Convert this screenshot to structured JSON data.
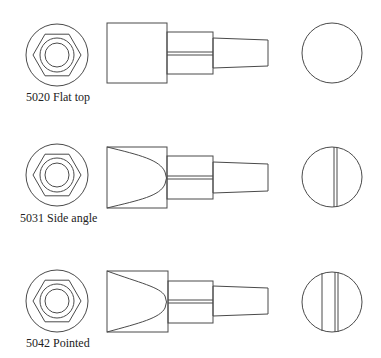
{
  "diagram": {
    "type": "technical drawing",
    "stroke_color": "#4a4a4a",
    "background": "#ffffff",
    "variants": [
      {
        "label": "5020 Flat top",
        "tip_style": "flat",
        "end_face_lines": 0
      },
      {
        "label": "5031 Side angle",
        "tip_style": "curved-bevel",
        "end_face_lines": 1
      },
      {
        "label": "5042 Pointed",
        "tip_style": "curved-bevel",
        "end_face_lines": 2
      }
    ]
  }
}
